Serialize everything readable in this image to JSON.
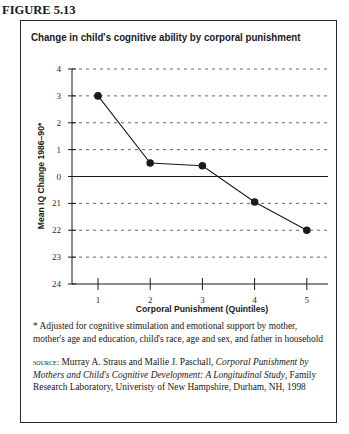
{
  "figure": {
    "label": "FIGURE 5.13"
  },
  "chart_data": {
    "type": "line",
    "title": "Change in child's cognitive ability by corporal punishment",
    "xlabel": "Corporal Punishment (Quintiles)",
    "ylabel": "Mean IQ Change 1986–90*",
    "categories": [
      "1",
      "2",
      "3",
      "4",
      "5"
    ],
    "x": [
      1,
      2,
      3,
      4,
      5
    ],
    "values": [
      3.0,
      0.5,
      0.4,
      -0.95,
      -2.0
    ],
    "series": [
      {
        "name": "Mean IQ Change",
        "values": [
          3.0,
          0.5,
          0.4,
          -0.95,
          -2.0
        ]
      }
    ],
    "ylim": [
      -4,
      4
    ],
    "y_ticks": [
      4,
      3,
      2,
      1,
      0,
      -1,
      -2,
      -3,
      -4
    ],
    "y_tick_labels": [
      "4",
      "3",
      "2",
      "1",
      "0",
      "21",
      "22",
      "23",
      "24"
    ],
    "x_tick_labels": [
      "1",
      "2",
      "3",
      "4",
      "5"
    ],
    "grid": "horizontal dashed at each integer tick; solid line at 0",
    "legend": "none",
    "marker": "filled circle"
  },
  "footnote": {
    "text": "* Adjusted for cognitive stimulation and emotional support by mother, mother's age and education, child's race, age and sex, and father in household"
  },
  "source": {
    "lead": "source:",
    "authors": " Murray A. Straus and Mallie J. Paschall, ",
    "title": "Corporal Punishment by Mothers and Child's Cognitive Development: A Longitudinal Study",
    "rest": ", Family Research Laboratory, Univeristy of New Hampshire, Durham, NH, 1998"
  },
  "colors": {
    "ink": "#1a1a1a",
    "grid": "#555555",
    "background": "#ffffff"
  }
}
